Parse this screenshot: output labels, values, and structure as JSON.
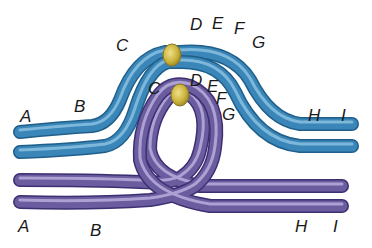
{
  "diagram": {
    "type": "chromosome-inversion-loop",
    "colors": {
      "background": "#ffffff",
      "blue_chromosome": "#3a86b8",
      "blue_dark": "#1f5f8a",
      "blue_highlight": "#8fc4e4",
      "purple_chromosome": "#6a5c9e",
      "purple_dark": "#3c2f72",
      "purple_highlight": "#bdb3de",
      "centromere": "#c9b23a",
      "centromere_dark": "#8a7620",
      "label": "#1a1a1a"
    },
    "blue_chromosome": {
      "labels": {
        "A": "A",
        "B": "B",
        "C": "C",
        "D": "D",
        "E": "E",
        "F": "F",
        "G": "G",
        "H": "H",
        "I": "I"
      }
    },
    "purple_chromosome": {
      "labels": {
        "A": "A",
        "B": "B",
        "C": "C",
        "D": "D",
        "E": "E",
        "F": "F",
        "G": "G",
        "H": "H",
        "I": "I"
      }
    }
  }
}
